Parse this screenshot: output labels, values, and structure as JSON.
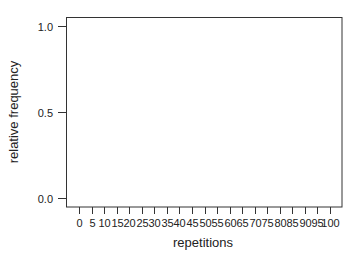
{
  "chart_data": {
    "type": "bar",
    "title": "",
    "xlabel": "repetitions",
    "ylabel": "relative frequency",
    "x_ticks": [
      0,
      5,
      10,
      15,
      20,
      25,
      30,
      35,
      40,
      45,
      50,
      55,
      60,
      65,
      70,
      75,
      80,
      85,
      90,
      95,
      100
    ],
    "x_tick_labels": [
      "0",
      "5",
      "10",
      "15",
      "20",
      "25",
      "30",
      "35",
      "40",
      "45",
      "50",
      "55",
      "60",
      "65",
      "70",
      "75",
      "80",
      "85",
      "90",
      "95",
      "100"
    ],
    "y_ticks": [
      0.0,
      0.5,
      1.0
    ],
    "y_tick_labels": [
      "0.0",
      "0.5",
      "1.0"
    ],
    "xlim": [
      0,
      100
    ],
    "ylim": [
      0.0,
      1.0
    ],
    "grid": false,
    "legend": null,
    "series": [],
    "categories": [],
    "values": [],
    "note_empty": "plot area contains no drawn data"
  },
  "colors": {
    "axis": "#333333",
    "text": "#222222",
    "background": "#ffffff"
  }
}
